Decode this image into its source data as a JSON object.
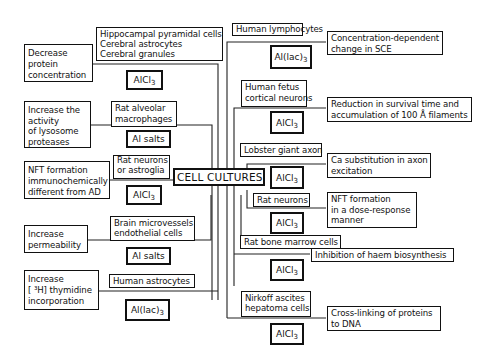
{
  "center": {
    "label": "CELL CULTURES"
  },
  "left_branches": [
    {
      "culture": [
        "Hippocampal pyramidal cells",
        "Cerebral astrocytes",
        "Cerebral granules"
      ],
      "agent": {
        "base": "AlCl",
        "sub": "3"
      },
      "effect": [
        "Decrease",
        "protein",
        "concentration"
      ]
    },
    {
      "culture": [
        "Rat alveolar",
        "macrophages"
      ],
      "agent": {
        "base": "Al salts",
        "sub": ""
      },
      "effect": [
        "Increase the",
        "activity",
        "of lysosome",
        "proteases"
      ]
    },
    {
      "culture": [
        "Rat neurons",
        "or astroglia"
      ],
      "agent": {
        "base": "AlCl",
        "sub": "3"
      },
      "effect": [
        "NFT formation",
        "immunochemically",
        "different from AD"
      ]
    },
    {
      "culture": [
        "Brain microvessels",
        "endothelial cells"
      ],
      "agent": {
        "base": "Al salts",
        "sub": ""
      },
      "effect": [
        "Increase",
        "permeability"
      ]
    },
    {
      "culture": [
        "Human astrocytes"
      ],
      "agent": {
        "base": "Al(lac)",
        "sub": "3"
      },
      "effect": [
        "Increase",
        "[ ³H] thymidine",
        "incorporation"
      ]
    }
  ],
  "right_branches": [
    {
      "culture": [
        "Human lymphocytes"
      ],
      "agent": {
        "base": "Al(lac)",
        "sub": "3"
      },
      "effect": [
        "Concentration-dependent",
        "change in SCE"
      ]
    },
    {
      "culture": [
        "Human fetus",
        "cortical neurons"
      ],
      "agent": {
        "base": "AlCl",
        "sub": "3"
      },
      "effect": [
        "Reduction in survival time and",
        "accumulation of 100 Å filaments"
      ]
    },
    {
      "culture": [
        "Lobster giant axon"
      ],
      "agent": {
        "base": "AlCl",
        "sub": "3"
      },
      "effect": [
        "Ca substitution in axon",
        "excitation"
      ]
    },
    {
      "culture": [
        "Rat neurons"
      ],
      "agent": {
        "base": "AlCl",
        "sub": "3"
      },
      "effect": [
        "NFT formation",
        "in a dose-response",
        "manner"
      ]
    },
    {
      "culture": [
        "Rat bone marrow cells"
      ],
      "agent": {
        "base": "AlCl",
        "sub": "3"
      },
      "effect": [
        "Inhibition of haem biosynthesis"
      ]
    },
    {
      "culture": [
        "Nirkoff ascites",
        "hepatoma cells"
      ],
      "agent": {
        "base": "AlCl",
        "sub": "3"
      },
      "effect": [
        "Cross-linking of proteins",
        "to DNA"
      ]
    }
  ]
}
